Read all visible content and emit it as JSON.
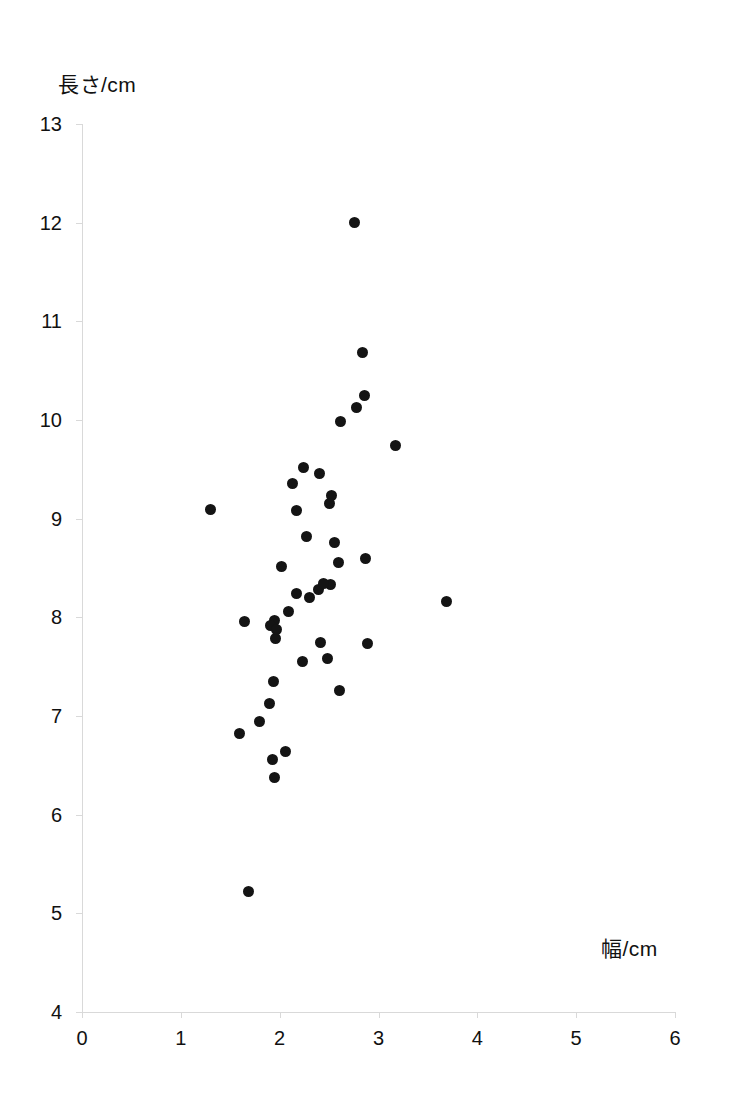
{
  "chart_data": {
    "type": "scatter",
    "title": "",
    "subtitle": "",
    "xlabel": "幅/cm",
    "ylabel": "長さ/cm",
    "xlim": [
      0,
      6
    ],
    "ylim": [
      4,
      13
    ],
    "xticks": [
      "0",
      "1",
      "2",
      "3",
      "4",
      "5",
      "6"
    ],
    "yticks": [
      "13",
      "12",
      "11",
      "10",
      "9",
      "8",
      "7",
      "6",
      "5",
      "4"
    ],
    "xtick_values": [
      0,
      1,
      2,
      3,
      4,
      5,
      6
    ],
    "ytick_values": [
      13,
      12,
      11,
      10,
      9,
      8,
      7,
      6,
      5,
      4
    ],
    "grid": false,
    "legend": null,
    "marker": "filled-circle",
    "marker_color": "#141414",
    "axis_color": "#d9d9d9",
    "background_color": "#ffffff",
    "n_points": 43,
    "points": [
      {
        "x": 2.76,
        "y": 12.0
      },
      {
        "x": 2.84,
        "y": 10.68
      },
      {
        "x": 2.86,
        "y": 10.25
      },
      {
        "x": 2.78,
        "y": 10.13
      },
      {
        "x": 2.62,
        "y": 9.98
      },
      {
        "x": 3.17,
        "y": 9.74
      },
      {
        "x": 2.24,
        "y": 9.52
      },
      {
        "x": 2.4,
        "y": 9.46
      },
      {
        "x": 2.13,
        "y": 9.36
      },
      {
        "x": 2.52,
        "y": 9.23
      },
      {
        "x": 1.3,
        "y": 9.09
      },
      {
        "x": 2.17,
        "y": 9.08
      },
      {
        "x": 2.5,
        "y": 9.15
      },
      {
        "x": 2.27,
        "y": 8.82
      },
      {
        "x": 2.55,
        "y": 8.76
      },
      {
        "x": 2.87,
        "y": 8.6
      },
      {
        "x": 2.6,
        "y": 8.56
      },
      {
        "x": 2.02,
        "y": 8.52
      },
      {
        "x": 2.51,
        "y": 8.33
      },
      {
        "x": 2.17,
        "y": 8.24
      },
      {
        "x": 2.39,
        "y": 8.28
      },
      {
        "x": 2.09,
        "y": 8.06
      },
      {
        "x": 3.69,
        "y": 8.16
      },
      {
        "x": 1.64,
        "y": 7.96
      },
      {
        "x": 1.95,
        "y": 7.97
      },
      {
        "x": 1.91,
        "y": 7.92
      },
      {
        "x": 1.96,
        "y": 7.79
      },
      {
        "x": 2.89,
        "y": 7.73
      },
      {
        "x": 2.41,
        "y": 7.75
      },
      {
        "x": 2.23,
        "y": 7.55
      },
      {
        "x": 2.48,
        "y": 7.58
      },
      {
        "x": 1.94,
        "y": 7.35
      },
      {
        "x": 2.61,
        "y": 7.26
      },
      {
        "x": 1.9,
        "y": 7.13
      },
      {
        "x": 1.8,
        "y": 6.94
      },
      {
        "x": 1.59,
        "y": 6.82
      },
      {
        "x": 2.06,
        "y": 6.64
      },
      {
        "x": 1.93,
        "y": 6.56
      },
      {
        "x": 1.95,
        "y": 6.38
      },
      {
        "x": 1.68,
        "y": 5.22
      },
      {
        "x": 2.44,
        "y": 8.34
      },
      {
        "x": 2.3,
        "y": 8.2
      },
      {
        "x": 1.97,
        "y": 7.88
      }
    ]
  },
  "axes": {
    "y_title": "長さ/cm",
    "x_title": "幅/cm"
  }
}
